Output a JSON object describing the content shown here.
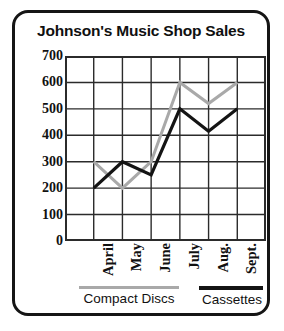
{
  "chart_data": {
    "type": "line",
    "title": "Johnson's Music Shop Sales",
    "xlabel": "",
    "ylabel": "",
    "categories": [
      "April",
      "May",
      "June",
      "July",
      "Aug.",
      "Sept."
    ],
    "ylim": [
      0,
      700
    ],
    "yticks": [
      0,
      100,
      200,
      300,
      400,
      500,
      600,
      700
    ],
    "ytick_labels": [
      "0",
      "100",
      "200",
      "300",
      "400",
      "500",
      "600",
      "700"
    ],
    "grid": true,
    "legend_position": "bottom",
    "series": [
      {
        "name": "Compact Discs",
        "color": "#a9a9a9",
        "values": [
          300,
          200,
          300,
          600,
          520,
          600
        ]
      },
      {
        "name": "Cassettes",
        "color": "#141414",
        "values": [
          200,
          300,
          250,
          500,
          415,
          500
        ]
      }
    ]
  },
  "legend": {
    "entries": [
      {
        "label": "Compact Discs",
        "swatch_name": "legend-swatch-compact-discs"
      },
      {
        "label": "Cassettes",
        "swatch_name": "legend-swatch-cassettes"
      }
    ]
  },
  "colors": {
    "frame": "#151515",
    "grid": "#2b2b2b",
    "compact_discs": "#a9a9a9",
    "cassettes": "#141414",
    "background": "#ffffff",
    "text": "#111111"
  }
}
